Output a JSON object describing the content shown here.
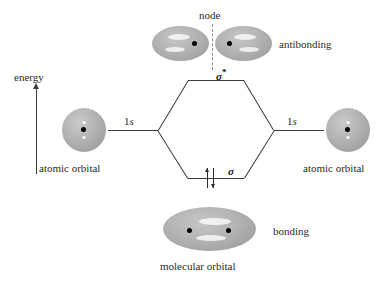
{
  "diagram": {
    "axis": {
      "energy_label": "energy",
      "direction": "up"
    },
    "labels": {
      "node": "node",
      "sigma_star": "σ",
      "sigma_star_superscript": "*",
      "sigma": "σ",
      "antibonding": "antibonding",
      "bonding": "bonding",
      "molecular_orbital": "molecular orbital",
      "atomic_orbital_left": "atomic orbital",
      "atomic_orbital_right": "atomic orbital",
      "level_left": "1",
      "level_left_italic": "s",
      "level_right": "1",
      "level_right_italic": "s"
    },
    "colors": {
      "orbital_fill": "#b0b0b0",
      "orbital_edge": "#9a9a9a",
      "nucleus": "#000000",
      "line": "#3a3a3a",
      "node_dash": "#8d8d8d",
      "background": "#ffffff",
      "text": "#2b2b2b"
    },
    "electrons": {
      "bonding_level_count": 2,
      "spins": [
        "up",
        "down"
      ]
    }
  }
}
